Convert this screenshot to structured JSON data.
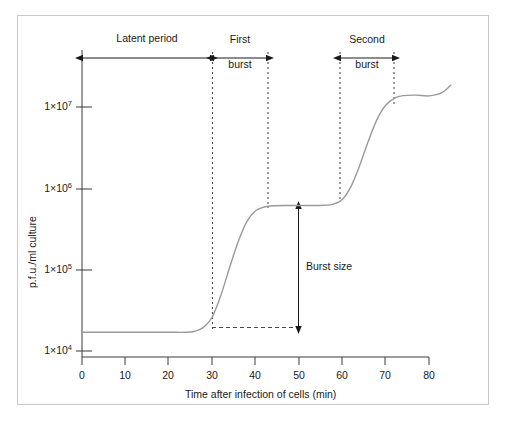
{
  "chart_data": {
    "type": "line",
    "title": "",
    "xlabel": "Time after infection of cells (min)",
    "ylabel": "p.f.u./ml culture",
    "xlim": [
      0,
      85
    ],
    "ylim_log10": [
      3.72,
      7.63
    ],
    "yscale": "log",
    "grid": false,
    "legend": null,
    "x_ticks": [
      0,
      10,
      20,
      30,
      40,
      50,
      60,
      70,
      80
    ],
    "x_tick_labels": [
      "0",
      "10",
      "20",
      "30",
      "40",
      "50",
      "60",
      "70",
      "80"
    ],
    "y_ticks_log10": [
      4,
      5,
      6,
      7
    ],
    "y_tick_labels": [
      "1×10⁴",
      "1×10⁵",
      "1×10⁶",
      "1×10⁷"
    ],
    "series": [
      {
        "name": "p.f.u./ml culture",
        "color": "#9a9a9a",
        "points": [
          {
            "x": 0,
            "y": 17000
          },
          {
            "x": 5,
            "y": 17000
          },
          {
            "x": 10,
            "y": 17000
          },
          {
            "x": 15,
            "y": 17000
          },
          {
            "x": 20,
            "y": 17000
          },
          {
            "x": 24,
            "y": 17000
          },
          {
            "x": 26,
            "y": 17500
          },
          {
            "x": 28,
            "y": 19500
          },
          {
            "x": 30,
            "y": 26000
          },
          {
            "x": 32,
            "y": 48000
          },
          {
            "x": 34,
            "y": 105000.0
          },
          {
            "x": 36,
            "y": 220000.0
          },
          {
            "x": 38,
            "y": 390000.0
          },
          {
            "x": 40,
            "y": 530000.0
          },
          {
            "x": 42,
            "y": 590000.0
          },
          {
            "x": 44,
            "y": 610000.0
          },
          {
            "x": 48,
            "y": 615000.0
          },
          {
            "x": 52,
            "y": 615000.0
          },
          {
            "x": 56,
            "y": 620000.0
          },
          {
            "x": 58,
            "y": 640000.0
          },
          {
            "x": 60,
            "y": 730000.0
          },
          {
            "x": 62,
            "y": 1050000.0
          },
          {
            "x": 64,
            "y": 1900000.0
          },
          {
            "x": 66,
            "y": 3800000.0
          },
          {
            "x": 68,
            "y": 7000000.0
          },
          {
            "x": 70,
            "y": 10500000.0
          },
          {
            "x": 72,
            "y": 12800000.0
          },
          {
            "x": 74,
            "y": 13800000.0
          },
          {
            "x": 77,
            "y": 14000000.0
          },
          {
            "x": 80,
            "y": 13700000.0
          },
          {
            "x": 83,
            "y": 15000000.0
          },
          {
            "x": 85,
            "y": 18500000.0
          }
        ]
      }
    ],
    "annotations": [
      {
        "name": "latent-period",
        "label": "Latent period",
        "type": "double-arrow-h",
        "x_start": 0,
        "x_end": 30,
        "y_level_px": 58
      },
      {
        "name": "first-burst",
        "label": "First\nburst",
        "type": "double-arrow-h",
        "x_start": 30,
        "x_end": 43,
        "y_level_px": 58
      },
      {
        "name": "second-burst",
        "label": "Second\nburst",
        "type": "double-arrow-h",
        "x_start": 60.5,
        "x_end": 73,
        "y_level_px": 58
      },
      {
        "name": "burst-size",
        "label": "Burst size",
        "type": "double-arrow-v",
        "x_at": 50,
        "y_top": 615000.0,
        "y_bottom": 17000
      }
    ],
    "guide_lines": [
      {
        "name": "first-burst-start",
        "orientation": "vertical",
        "x": 30,
        "style": "dotted"
      },
      {
        "name": "first-burst-end",
        "orientation": "vertical",
        "x": 43,
        "style": "dotted"
      },
      {
        "name": "second-burst-start",
        "orientation": "vertical",
        "x": 60.5,
        "style": "dotted"
      },
      {
        "name": "second-burst-end",
        "orientation": "vertical",
        "x": 73,
        "style": "dotted"
      },
      {
        "name": "baseline-level",
        "orientation": "horizontal",
        "y": 17000,
        "style": "dashed"
      }
    ]
  },
  "axes": {
    "x_title": "Time after infection of cells (min)",
    "y_title": "p.f.u./ml culture",
    "x_tick_labels": [
      "0",
      "10",
      "20",
      "30",
      "40",
      "50",
      "60",
      "70",
      "80"
    ],
    "y_tick_labels": [
      {
        "mantissa": "1×10",
        "exponent": "4"
      },
      {
        "mantissa": "1×10",
        "exponent": "5"
      },
      {
        "mantissa": "1×10",
        "exponent": "6"
      },
      {
        "mantissa": "1×10",
        "exponent": "7"
      }
    ]
  },
  "labels": {
    "latent_period": "Latent period",
    "first_burst_line1": "First",
    "first_burst_line2": "burst",
    "second_burst_line1": "Second",
    "second_burst_line2": "burst",
    "burst_size": "Burst size"
  },
  "colors": {
    "curve": "#9a9a9a",
    "axis": "#3a3a3a",
    "annotation": "#1a1a1a",
    "frame": "#c9c9c9",
    "background": "#ffffff"
  }
}
